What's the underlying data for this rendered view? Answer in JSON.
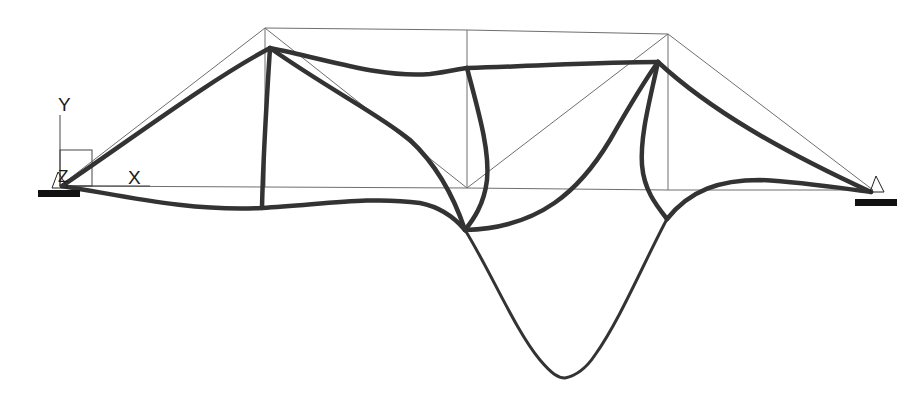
{
  "view": {
    "title": "Truss deformed shape",
    "colors": {
      "background": "#ffffff",
      "undeformed": "#6e6e6e",
      "deformed": "#333333",
      "support": "#111111"
    }
  },
  "axes": {
    "y_label": "Y",
    "x_label": "X",
    "z_label": "Z"
  },
  "supports": [
    {
      "name": "left-support",
      "type": "pin",
      "x": 60,
      "y": 186
    },
    {
      "name": "right-support",
      "type": "pin",
      "x": 873,
      "y": 190
    }
  ],
  "undeformed_nodes": {
    "bottom": [
      [
        60,
        186
      ],
      [
        265,
        187
      ],
      [
        467,
        188
      ],
      [
        668,
        190
      ],
      [
        873,
        190
      ]
    ],
    "top": [
      [
        265,
        28
      ],
      [
        467,
        30
      ],
      [
        668,
        34
      ]
    ]
  },
  "deformed_nodes": {
    "left_support": [
      62,
      186
    ],
    "top_left": [
      270,
      48
    ],
    "top_right": [
      658,
      62
    ],
    "bottom_left": [
      262,
      208
    ],
    "mid_vertical_top": [
      467,
      68
    ],
    "center_bottom": [
      465,
      230
    ],
    "right_bottom": [
      667,
      219
    ],
    "right_support": [
      871,
      192
    ],
    "sag_bottom": [
      565,
      378
    ]
  }
}
